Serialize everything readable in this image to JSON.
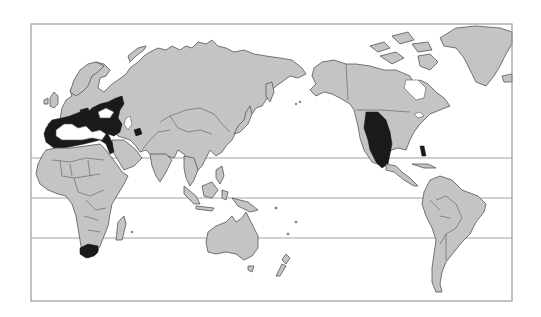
{
  "map": {
    "type": "world-distribution-map",
    "projection": "pacific-centered",
    "frame": {
      "x": 31,
      "y": 24,
      "width": 481,
      "height": 277
    },
    "colors": {
      "background": "#ffffff",
      "land": "#c4c4c4",
      "coastline": "#555555",
      "distribution": "#1a1a1a",
      "latitude_lines": "#8a8a8a",
      "frame": "#9a9a9a"
    },
    "latitude_lines": [
      {
        "name": "tropic-of-cancer",
        "y": 158
      },
      {
        "name": "equator",
        "y": 198
      },
      {
        "name": "tropic-of-capricorn",
        "y": 238
      }
    ],
    "landmasses": [
      "Europe",
      "Asia",
      "Africa",
      "Australia",
      "New Zealand",
      "North America",
      "Greenland",
      "South America",
      "Central America",
      "Caribbean",
      "Japan",
      "Maritime Southeast Asia",
      "Madagascar"
    ],
    "distribution_regions": [
      {
        "name": "Mediterranean Basin",
        "highlighted": true
      },
      {
        "name": "Southern Africa (Cape region)",
        "highlighted": true
      },
      {
        "name": "Western North America / Mexico",
        "highlighted": true
      }
    ]
  }
}
